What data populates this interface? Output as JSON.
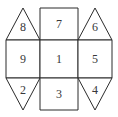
{
  "figure": {
    "kind": "polyhedron-net-diagram",
    "stroke_color": "#2b2b2b",
    "label_color": "#38383a",
    "background_color": "#ffffff",
    "stroke_width": 1,
    "viewbox": "0 0 118 117"
  },
  "faces": [
    {
      "id": "face-8",
      "label": "8",
      "shape": "triangle-up",
      "position": "top-left",
      "points": "6,40 23,8 40,40",
      "label_x": 23,
      "label_y": 27
    },
    {
      "id": "face-7",
      "label": "7",
      "shape": "square",
      "position": "top-center",
      "points": "40,8 78,8 78,40 40,40",
      "label_x": 59,
      "label_y": 19
    },
    {
      "id": "face-6",
      "label": "6",
      "shape": "triangle-up",
      "position": "top-right",
      "points": "78,40 95,8 112,40",
      "label_x": 95,
      "label_y": 27
    },
    {
      "id": "face-9",
      "label": "9",
      "shape": "square",
      "position": "middle-left",
      "points": "6,40 40,40 40,78 6,78",
      "label_x": 23,
      "label_y": 53
    },
    {
      "id": "face-1",
      "label": "1",
      "shape": "square",
      "position": "middle-center",
      "points": "40,40 78,40 78,78 40,78",
      "label_x": 59,
      "label_y": 53
    },
    {
      "id": "face-5",
      "label": "5",
      "shape": "square",
      "position": "middle-right",
      "points": "78,40 112,40 112,78 78,78",
      "label_x": 95,
      "label_y": 53
    },
    {
      "id": "face-2",
      "label": "2",
      "shape": "triangle-down",
      "position": "bottom-left",
      "points": "6,78 40,78 23,110",
      "label_x": 23,
      "label_y": 85
    },
    {
      "id": "face-3",
      "label": "3",
      "shape": "square",
      "position": "bottom-center",
      "points": "40,78 78,78 78,110 40,110",
      "label_x": 59,
      "label_y": 88
    },
    {
      "id": "face-4",
      "label": "4",
      "shape": "triangle-down",
      "position": "bottom-right",
      "points": "78,78 112,78 95,110",
      "label_x": 95,
      "label_y": 85
    }
  ]
}
